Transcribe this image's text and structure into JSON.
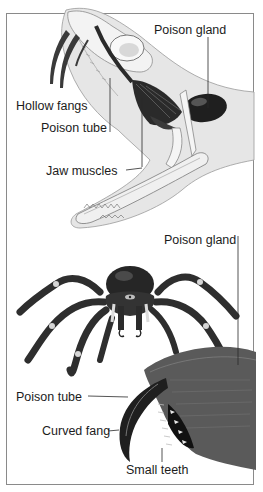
{
  "figure": {
    "panels": [
      {
        "subject": "Snake head (cutaway)",
        "labels": [
          {
            "id": "snake-poison-gland",
            "text": "Poison gland"
          },
          {
            "id": "snake-hollow-fangs",
            "text": "Hollow fangs"
          },
          {
            "id": "snake-poison-tube",
            "text": "Poison tube"
          },
          {
            "id": "snake-jaw-muscles",
            "text": "Jaw muscles"
          }
        ]
      },
      {
        "subject": "Spider with enlarged chelicera",
        "labels": [
          {
            "id": "spider-poison-gland",
            "text": "Poison gland"
          },
          {
            "id": "spider-poison-tube",
            "text": "Poison tube"
          },
          {
            "id": "spider-curved-fang",
            "text": "Curved fang"
          },
          {
            "id": "spider-small-teeth",
            "text": "Small teeth"
          }
        ]
      }
    ],
    "colors": {
      "frame": "#8a8a8a",
      "leader": "#2a2a2a",
      "text": "#1c1c1c",
      "snake_skin": "#e4e4e4",
      "bone": "#f4f4f4",
      "gland": "#1e1e1e",
      "spider_body": "#2b2b2b"
    }
  }
}
